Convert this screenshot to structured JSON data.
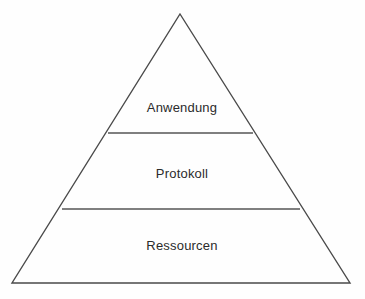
{
  "diagram": {
    "type": "pyramid",
    "title": "",
    "language": "de",
    "background_color": "#fefefe",
    "line_color": "#4a4a4a",
    "text_color": "#2b2b2b",
    "apex": {
      "x": 180,
      "y": 14
    },
    "base_left": {
      "x": 12,
      "y": 283
    },
    "base_right": {
      "x": 350,
      "y": 283
    },
    "tiers": [
      {
        "label": "Anwendung",
        "level": 1,
        "position": "top",
        "label_center": {
          "x": 182,
          "y": 107
        },
        "divider_below": {
          "y": 133,
          "x1": 108,
          "x2": 253
        }
      },
      {
        "label": "Protokoll",
        "level": 2,
        "position": "middle",
        "label_center": {
          "x": 182,
          "y": 173
        },
        "divider_below": {
          "y": 209,
          "x1": 62,
          "x2": 300
        }
      },
      {
        "label": "Ressourcen",
        "level": 3,
        "position": "bottom",
        "label_center": {
          "x": 182,
          "y": 245
        },
        "divider_below": null
      }
    ]
  }
}
